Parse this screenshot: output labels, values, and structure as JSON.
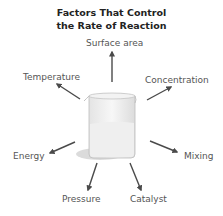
{
  "title": {
    "line1": "Factors That Control",
    "line2": "the Rate of Reaction"
  },
  "center": "beaker-icon",
  "factors": [
    {
      "label": "Surface area"
    },
    {
      "label": "Temperature"
    },
    {
      "label": "Concentration"
    },
    {
      "label": "Energy"
    },
    {
      "label": "Mixing"
    },
    {
      "label": "Pressure"
    },
    {
      "label": "Catalyst"
    }
  ],
  "colors": {
    "arrow": "#4a4a4a",
    "text": "#555555",
    "title": "#222222",
    "liquid": "#e6e6e6",
    "shadow": "#cfcfcf"
  }
}
